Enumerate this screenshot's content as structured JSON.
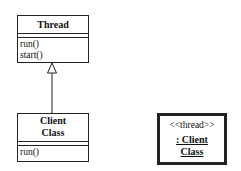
{
  "diagram": {
    "type": "UML class diagram",
    "classes": [
      {
        "id": "thread",
        "name": "Thread",
        "attributes": [],
        "operations": [
          "run()",
          "start()"
        ]
      },
      {
        "id": "client",
        "name_line1": "Client",
        "name_line2": "Class",
        "attributes": [],
        "operations": [
          "run()"
        ]
      }
    ],
    "relationships": [
      {
        "type": "generalization",
        "from": "client",
        "to": "thread"
      }
    ],
    "object": {
      "stereotype": "<<thread>>",
      "name_line1": ": Client",
      "name_line2": "Class"
    }
  }
}
